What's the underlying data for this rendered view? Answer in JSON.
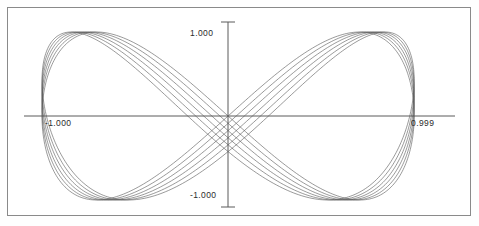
{
  "window": {
    "title": "Plot",
    "background_color": "#ffffff",
    "frame_color": "#8a8a8a"
  },
  "axes": {
    "label_top": "1.000",
    "label_bottom": "-1.000",
    "label_left": "-1.000",
    "label_right": "0.999",
    "axis_color": "#5a5a5a",
    "origin_x_px": 228,
    "origin_y_px": 116
  },
  "chart_data": {
    "type": "line",
    "title": "",
    "subtitle": "",
    "xlabel": "",
    "ylabel": "",
    "grid": false,
    "legend": null,
    "xlim": [
      -1.0,
      0.999
    ],
    "ylim": [
      -1.0,
      1.0
    ],
    "xticks": [
      -1.0,
      0.999
    ],
    "yticks": [
      -1.0,
      1.0
    ],
    "xtick_labels": [
      "-1.000",
      "0.999"
    ],
    "ytick_labels": [
      "-1.000",
      "1.000"
    ],
    "line_color": "#555555",
    "line_width": 0.6,
    "trace_count": 6,
    "series": [
      {
        "name": "trace-1",
        "phase": 0.0,
        "x": [
          -1.0,
          -0.809,
          -0.309,
          0.309,
          0.809,
          1.0,
          0.809,
          0.309,
          -0.309,
          -0.809,
          -1.0
        ],
        "y": [
          0.0,
          0.588,
          0.951,
          0.951,
          0.588,
          0.0,
          -0.588,
          -0.951,
          -0.951,
          -0.588,
          0.0
        ]
      },
      {
        "name": "trace-2",
        "phase": 0.035,
        "x": [
          -0.998,
          -0.8,
          -0.296,
          0.322,
          0.816,
          0.999,
          0.8,
          0.296,
          -0.322,
          -0.816,
          -0.998
        ],
        "y": [
          0.035,
          0.615,
          0.96,
          0.938,
          0.56,
          -0.035,
          -0.615,
          -0.96,
          -0.938,
          -0.56,
          0.035
        ]
      },
      {
        "name": "trace-3",
        "phase": 0.07,
        "x": [
          -0.996,
          -0.791,
          -0.283,
          0.335,
          0.823,
          0.997,
          0.791,
          0.283,
          -0.335,
          -0.823,
          -0.996
        ],
        "y": [
          0.07,
          0.641,
          0.968,
          0.924,
          0.531,
          -0.07,
          -0.641,
          -0.968,
          -0.924,
          -0.531,
          0.07
        ]
      },
      {
        "name": "trace-4",
        "phase": 0.105,
        "x": [
          -0.993,
          -0.781,
          -0.27,
          0.348,
          0.83,
          0.994,
          0.781,
          0.27,
          -0.348,
          -0.83,
          -0.993
        ],
        "y": [
          0.105,
          0.666,
          0.975,
          0.909,
          0.502,
          -0.105,
          -0.666,
          -0.975,
          -0.909,
          -0.502,
          0.105
        ]
      },
      {
        "name": "trace-5",
        "phase": 0.14,
        "x": [
          -0.99,
          -0.771,
          -0.257,
          0.361,
          0.836,
          0.99,
          0.771,
          0.257,
          -0.361,
          -0.836,
          -0.99
        ],
        "y": [
          0.14,
          0.69,
          0.981,
          0.893,
          0.472,
          -0.14,
          -0.69,
          -0.981,
          -0.893,
          -0.472,
          0.14
        ]
      },
      {
        "name": "trace-6",
        "phase": 0.175,
        "x": [
          -0.985,
          -0.76,
          -0.244,
          0.374,
          0.842,
          0.985,
          0.76,
          0.244,
          -0.374,
          -0.842,
          -0.985
        ],
        "y": [
          0.175,
          0.713,
          0.985,
          0.876,
          0.442,
          -0.175,
          -0.713,
          -0.985,
          -0.876,
          -0.442,
          0.175
        ]
      }
    ]
  }
}
